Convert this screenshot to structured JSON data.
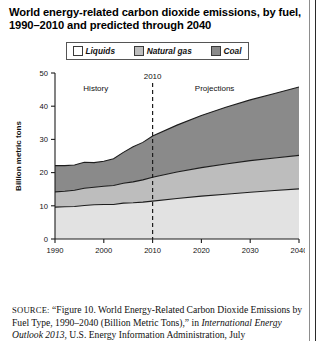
{
  "figure": {
    "title": "World energy-related carbon dioxide emissions, by fuel, 1990–2010 and predicted through 2040"
  },
  "legend": {
    "position": "top-center",
    "items": [
      {
        "label": "Liquids",
        "color": "#ffffff",
        "icon": "legend-swatch"
      },
      {
        "label": "Natural gas",
        "color": "#bdbdbd",
        "icon": "legend-swatch"
      },
      {
        "label": "Coal",
        "color": "#8a8a8a",
        "icon": "legend-swatch"
      }
    ]
  },
  "annotations": {
    "history": "History",
    "projections": "Projections",
    "divider_year": "2010"
  },
  "source": {
    "prefix": "SOURCE:",
    "line1": " “Figure 10. World Energy-Related Carbon Dioxide Emissions",
    "line2_a": "by Fuel Type, 1990–2040 (Billion Metric Tons),” in ",
    "line2_em": "International",
    "line3_em": "Energy Outlook 2013",
    "line3_b": ", U.S. Energy Information Administration, July"
  },
  "chart_data": {
    "type": "area",
    "stacked": true,
    "title": "World energy-related carbon dioxide emissions, by fuel, 1990–2010 and predicted through 2040",
    "xlabel": "",
    "ylabel": "Billion metric tons",
    "xlim": [
      1990,
      2040
    ],
    "ylim": [
      0,
      50
    ],
    "xticks": [
      1990,
      2000,
      2010,
      2020,
      2030,
      2040
    ],
    "yticks": [
      0,
      10,
      20,
      30,
      40,
      50
    ],
    "grid": false,
    "divider_x": 2010,
    "x": [
      1990,
      1992,
      1994,
      1996,
      1998,
      2000,
      2002,
      2004,
      2006,
      2008,
      2010,
      2015,
      2020,
      2025,
      2030,
      2035,
      2040
    ],
    "series": [
      {
        "name": "Liquids",
        "color": "#e2e2e2",
        "values": [
          9.6,
          9.7,
          9.8,
          10.1,
          10.3,
          10.4,
          10.4,
          10.8,
          10.9,
          11.1,
          11.4,
          12.2,
          12.9,
          13.5,
          14.1,
          14.6,
          15.1
        ]
      },
      {
        "name": "Natural gas",
        "color": "#bdbdbd",
        "values": [
          4.6,
          4.7,
          4.9,
          5.2,
          5.3,
          5.5,
          5.7,
          6.0,
          6.3,
          6.7,
          7.2,
          8.0,
          8.6,
          9.1,
          9.5,
          9.8,
          10.1
        ]
      },
      {
        "name": "Coal",
        "color": "#8a8a8a",
        "values": [
          7.9,
          7.7,
          7.6,
          7.8,
          7.4,
          7.5,
          8.1,
          9.3,
          10.6,
          11.3,
          12.4,
          14.1,
          15.7,
          17.1,
          18.3,
          19.4,
          20.6
        ]
      }
    ],
    "totals": [
      22.1,
      22.1,
      22.3,
      23.1,
      23.0,
      23.4,
      24.2,
      26.1,
      27.8,
      29.1,
      31.0,
      34.3,
      37.2,
      39.7,
      41.9,
      43.8,
      45.8
    ]
  }
}
